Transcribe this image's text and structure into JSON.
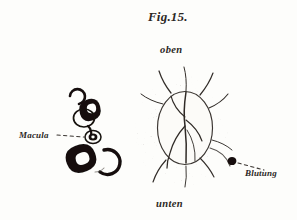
{
  "plate": {
    "title": "Fig.15.",
    "background_color": "#fdfdfb",
    "ink_color": "#2b2724"
  },
  "labels": {
    "top": "oben",
    "bottom": "unten",
    "left": "Macula",
    "right": "Blutung"
  },
  "figure": {
    "optic_disc_label": "optic-disc",
    "halo_label": "stippled-halo",
    "hemorrhage_label": "hemorrhage-dot",
    "macula_cluster_label": "macula-pigment-cluster"
  }
}
